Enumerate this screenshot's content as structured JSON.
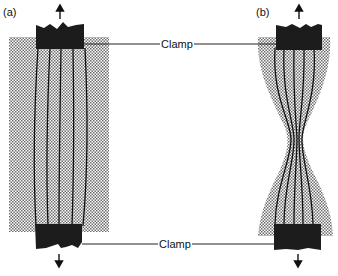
{
  "figure": {
    "panels": [
      {
        "id": "a",
        "label": "(a)",
        "description": "Rectangular specimen held between top and bottom clamps; fiber lines run nearly straight and parallel",
        "fiber_count": 5
      },
      {
        "id": "b",
        "label": "(b)",
        "description": "Specimen necks in the middle under tension; fiber lines converge toward the narrow waist",
        "fiber_count": 5
      }
    ],
    "clamp_labels": {
      "top": "Clamp",
      "bottom": "Clamp"
    },
    "force_arrows": {
      "top": "up",
      "bottom": "down"
    },
    "colors": {
      "clamp_fill": "#1c1c1c",
      "specimen_dots": "#7a7a7a",
      "fiber_line": "#111111",
      "leader_line": "#222222"
    }
  }
}
